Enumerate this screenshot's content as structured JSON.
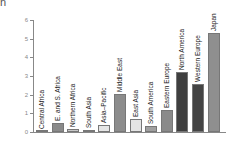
{
  "chart_data": {
    "type": "bar",
    "title": "",
    "unit_label": "n",
    "xlabel": "",
    "ylabel": "",
    "ylim": [
      0,
      6
    ],
    "yticks": [
      "0",
      "1",
      "2",
      "3",
      "4",
      "5",
      "6"
    ],
    "grid": false,
    "categories": [
      "Central Africa",
      "E. and S. Africa",
      "Northern Africa",
      "South Asia",
      "Asia–Pacific",
      "Middle East",
      "East Asia",
      "South America",
      "Eastern Europe",
      "North America",
      "Western Europe",
      "Japan"
    ],
    "values": [
      0.05,
      0.5,
      0.15,
      0.1,
      0.35,
      2.05,
      0.7,
      0.3,
      1.2,
      3.2,
      2.55,
      5.3
    ],
    "colors": [
      "#6e6e6e",
      "#8a8a8a",
      "#c8c8c8",
      "#b0b0b0",
      "#e6e6e6",
      "#8c8c8c",
      "#e4e4e4",
      "#a0a0a0",
      "#8a8a8a",
      "#3f3f3f",
      "#444444",
      "#8f8f8f"
    ]
  }
}
